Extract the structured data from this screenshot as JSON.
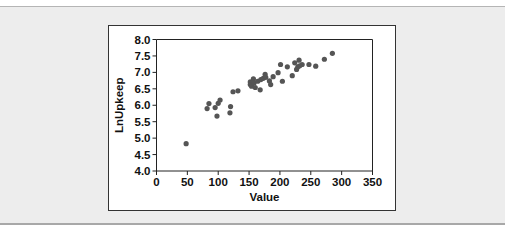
{
  "chart_data": {
    "type": "scatter",
    "title": "",
    "xlabel": "Value",
    "ylabel": "LnUpkeep",
    "xlim": [
      0,
      350
    ],
    "ylim": [
      4.0,
      8.0
    ],
    "xticks": [
      "0",
      "50",
      "100",
      "150",
      "200",
      "250",
      "300",
      "350"
    ],
    "yticks": [
      "4.0",
      "4.5",
      "5.0",
      "5.5",
      "6.0",
      "6.5",
      "7.0",
      "7.5",
      "8.0"
    ],
    "grid": false,
    "legend": "none",
    "point_color": "#555555",
    "points": [
      [
        48,
        4.83
      ],
      [
        82,
        5.9
      ],
      [
        85,
        6.05
      ],
      [
        95,
        5.93
      ],
      [
        98,
        5.67
      ],
      [
        100,
        6.06
      ],
      [
        103,
        6.16
      ],
      [
        119,
        5.77
      ],
      [
        120,
        5.96
      ],
      [
        124,
        6.41
      ],
      [
        132,
        6.44
      ],
      [
        152,
        6.71
      ],
      [
        152,
        6.63
      ],
      [
        154,
        6.58
      ],
      [
        157,
        6.8
      ],
      [
        158,
        6.68
      ],
      [
        160,
        6.54
      ],
      [
        164,
        6.73
      ],
      [
        168,
        6.47
      ],
      [
        169,
        6.78
      ],
      [
        173,
        6.82
      ],
      [
        176,
        6.94
      ],
      [
        177,
        6.85
      ],
      [
        183,
        6.74
      ],
      [
        185,
        6.63
      ],
      [
        189,
        6.87
      ],
      [
        197,
        6.99
      ],
      [
        201,
        7.24
      ],
      [
        204,
        6.73
      ],
      [
        212,
        7.17
      ],
      [
        220,
        6.9
      ],
      [
        224,
        7.29
      ],
      [
        227,
        7.09
      ],
      [
        229,
        7.17
      ],
      [
        231,
        7.37
      ],
      [
        232,
        7.2
      ],
      [
        236,
        7.24
      ],
      [
        247,
        7.24
      ],
      [
        258,
        7.19
      ],
      [
        272,
        7.4
      ],
      [
        285,
        7.58
      ]
    ]
  }
}
